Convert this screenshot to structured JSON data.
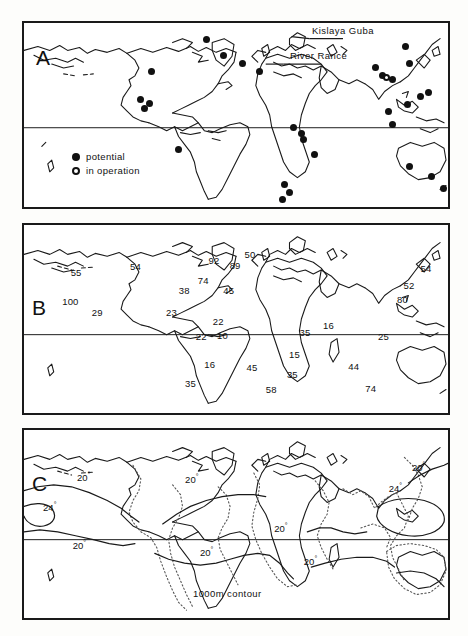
{
  "figure": {
    "panels": [
      {
        "id": "A",
        "letter": "A",
        "caption": "World map of tidal power sites"
      },
      {
        "id": "B",
        "letter": "B",
        "caption": "World map of tidal range values"
      },
      {
        "id": "C",
        "letter": "C",
        "caption": "World map of sea surface temperature contours"
      }
    ]
  },
  "panel_a": {
    "letter": "A",
    "annotations": [
      {
        "name": "kislaya-guba",
        "label": "Kislaya Guba"
      },
      {
        "name": "river-rance",
        "label": "River Rance"
      }
    ],
    "legend": {
      "potential": {
        "label": "potential",
        "symbol": "filled-circle"
      },
      "in_operation": {
        "label": "in operation",
        "symbol": "open-circle"
      }
    },
    "markers": [
      {
        "type": "potential",
        "x": 43.0,
        "y": 9.0
      },
      {
        "type": "potential",
        "x": 47.0,
        "y": 17.5
      },
      {
        "type": "potential",
        "x": 51.5,
        "y": 22.0
      },
      {
        "type": "potential",
        "x": 30.0,
        "y": 26.5
      },
      {
        "type": "potential",
        "x": 55.5,
        "y": 26.5
      },
      {
        "type": "potential",
        "x": 27.5,
        "y": 41.5
      },
      {
        "type": "potential",
        "x": 29.5,
        "y": 43.5
      },
      {
        "type": "potential",
        "x": 28.5,
        "y": 46.5
      },
      {
        "type": "potential",
        "x": 63.5,
        "y": 57.0
      },
      {
        "type": "potential",
        "x": 65.5,
        "y": 60.0
      },
      {
        "type": "potential",
        "x": 66.0,
        "y": 63.5
      },
      {
        "type": "potential",
        "x": 68.5,
        "y": 71.5
      },
      {
        "type": "potential",
        "x": 61.5,
        "y": 88.0
      },
      {
        "type": "potential",
        "x": 62.5,
        "y": 92.0
      },
      {
        "type": "potential",
        "x": 61.0,
        "y": 96.0
      },
      {
        "type": "potential",
        "x": 36.5,
        "y": 69.0
      },
      {
        "type": "potential",
        "x": 83.0,
        "y": 24.0
      },
      {
        "type": "potential",
        "x": 84.5,
        "y": 28.5
      },
      {
        "type": "potential",
        "x": 87.0,
        "y": 30.5
      },
      {
        "type": "in_operation",
        "x": 85.5,
        "y": 29.5
      },
      {
        "type": "potential",
        "x": 90.0,
        "y": 13.0
      },
      {
        "type": "potential",
        "x": 91.0,
        "y": 22.0
      },
      {
        "type": "potential",
        "x": 93.5,
        "y": 40.0
      },
      {
        "type": "potential",
        "x": 95.5,
        "y": 37.5
      },
      {
        "type": "potential",
        "x": 90.5,
        "y": 44.5
      },
      {
        "type": "potential",
        "x": 86.0,
        "y": 48.0
      },
      {
        "type": "potential",
        "x": 87.0,
        "y": 55.0
      },
      {
        "type": "potential",
        "x": 91.0,
        "y": 78.0
      },
      {
        "type": "potential",
        "x": 96.0,
        "y": 83.5
      },
      {
        "type": "potential",
        "x": 99.0,
        "y": 90.0
      }
    ]
  },
  "panel_b": {
    "letter": "B",
    "values": [
      {
        "value": "55",
        "x": 11.0,
        "y": 22.5
      },
      {
        "value": "54",
        "x": 25.0,
        "y": 19.0
      },
      {
        "value": "100",
        "x": 9.0,
        "y": 37.5
      },
      {
        "value": "29",
        "x": 16.0,
        "y": 43.5
      },
      {
        "value": "92",
        "x": 43.5,
        "y": 16.0
      },
      {
        "value": "50",
        "x": 52.0,
        "y": 12.5
      },
      {
        "value": "89",
        "x": 48.5,
        "y": 18.5
      },
      {
        "value": "74",
        "x": 41.0,
        "y": 26.5
      },
      {
        "value": "38",
        "x": 36.5,
        "y": 32.0
      },
      {
        "value": "45",
        "x": 47.0,
        "y": 32.0
      },
      {
        "value": "23",
        "x": 33.5,
        "y": 43.5
      },
      {
        "value": "22",
        "x": 44.5,
        "y": 48.5
      },
      {
        "value": "10",
        "x": 45.5,
        "y": 56.0
      },
      {
        "value": "22",
        "x": 40.5,
        "y": 56.5
      },
      {
        "value": "35",
        "x": 65.0,
        "y": 54.0
      },
      {
        "value": "16",
        "x": 70.5,
        "y": 50.5
      },
      {
        "value": "25",
        "x": 83.5,
        "y": 56.5
      },
      {
        "value": "54",
        "x": 93.5,
        "y": 20.0
      },
      {
        "value": "52",
        "x": 89.5,
        "y": 29.0
      },
      {
        "value": "80",
        "x": 88.0,
        "y": 36.5
      },
      {
        "value": "16",
        "x": 42.5,
        "y": 71.5
      },
      {
        "value": "35",
        "x": 38.0,
        "y": 81.5
      },
      {
        "value": "45",
        "x": 52.5,
        "y": 73.0
      },
      {
        "value": "58",
        "x": 57.0,
        "y": 84.5
      },
      {
        "value": "15",
        "x": 62.5,
        "y": 66.0
      },
      {
        "value": "35",
        "x": 62.0,
        "y": 76.5
      },
      {
        "value": "44",
        "x": 76.5,
        "y": 72.5
      },
      {
        "value": "74",
        "x": 80.5,
        "y": 84.0
      }
    ]
  },
  "panel_c": {
    "letter": "C",
    "contour_caption": "1000m contour",
    "contour_labels": [
      {
        "value": "20",
        "unit": "°",
        "x": 12.5,
        "y": 22.0
      },
      {
        "value": "24",
        "unit": "°",
        "x": 4.5,
        "y": 37.5
      },
      {
        "value": "20",
        "unit": "°",
        "x": 11.5,
        "y": 58.0
      },
      {
        "value": "20",
        "unit": "°",
        "x": 38.0,
        "y": 23.0
      },
      {
        "value": "20",
        "unit": "°",
        "x": 41.5,
        "y": 61.5
      },
      {
        "value": "20",
        "unit": "°",
        "x": 59.0,
        "y": 49.0
      },
      {
        "value": "20",
        "unit": "°",
        "x": 66.0,
        "y": 66.5
      },
      {
        "value": "20",
        "unit": "°",
        "x": 91.5,
        "y": 16.5
      },
      {
        "value": "24",
        "unit": "°",
        "x": 86.0,
        "y": 27.5
      }
    ]
  },
  "chart_data": {
    "type": "map",
    "panels": [
      {
        "panel": "A",
        "description": "Locations of potential and operating tidal power sites",
        "legend": [
          "potential",
          "in operation"
        ],
        "annotations": [
          "Kislaya Guba",
          "River Rance"
        ],
        "site_count_potential": 29,
        "site_count_in_operation": 1
      },
      {
        "panel": "B",
        "description": "Tidal range values at coastal locations",
        "values": [
          55,
          54,
          100,
          29,
          92,
          50,
          89,
          74,
          38,
          45,
          23,
          22,
          10,
          22,
          35,
          16,
          25,
          54,
          52,
          80,
          16,
          35,
          45,
          58,
          15,
          35,
          44,
          74
        ],
        "min": 10,
        "max": 100
      },
      {
        "panel": "C",
        "description": "Sea surface temperature isotherms and 1000m depth contour",
        "contour_levels": [
          20,
          24
        ],
        "contour_unit": "degrees",
        "depth_contour": "1000m contour"
      }
    ]
  }
}
